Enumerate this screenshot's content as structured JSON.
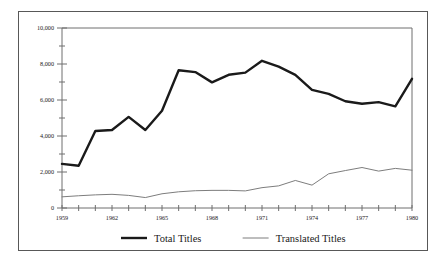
{
  "chart_data": {
    "type": "line",
    "title": "",
    "subtitle": "",
    "xlabel": "",
    "ylabel": "",
    "xlim": [
      1959,
      1980
    ],
    "ylim": [
      0,
      10000
    ],
    "grid": false,
    "legend_position": "bottom-center",
    "x": [
      1959,
      1960,
      1961,
      1962,
      1963,
      1964,
      1965,
      1966,
      1967,
      1968,
      1969,
      1970,
      1971,
      1972,
      1973,
      1974,
      1975,
      1976,
      1977,
      1978,
      1979,
      1980
    ],
    "x_tick_labels": [
      "1959",
      "1962",
      "1965",
      "1968",
      "1971",
      "1974",
      "1977",
      "1980"
    ],
    "x_tick_values": [
      1959,
      1962,
      1965,
      1968,
      1971,
      1974,
      1977,
      1980
    ],
    "y_tick_labels": [
      "0",
      "2,000",
      "4,000",
      "6,000",
      "8,000",
      "10,000"
    ],
    "y_tick_values": [
      0,
      2000,
      4000,
      6000,
      8000,
      10000
    ],
    "y_minor_tick_values": [
      1000,
      3000,
      5000,
      7000,
      9000
    ],
    "series": [
      {
        "name": "Total Titles",
        "color": "#1a1a1a",
        "width": 2.4,
        "values": [
          2450,
          2350,
          4280,
          4330,
          5060,
          4330,
          5400,
          7650,
          7550,
          6980,
          7400,
          7520,
          8180,
          7850,
          7400,
          6560,
          6340,
          5930,
          5790,
          5880,
          5650,
          7180
        ]
      },
      {
        "name": "Translated Titles",
        "color": "#7d7d7d",
        "width": 1.0,
        "values": [
          620,
          680,
          730,
          760,
          700,
          580,
          790,
          900,
          960,
          980,
          980,
          950,
          1130,
          1230,
          1530,
          1270,
          1900,
          2080,
          2250,
          2050,
          2200,
          2100
        ]
      }
    ]
  },
  "legend": {
    "items": [
      {
        "label": "Total Titles",
        "color": "#1a1a1a",
        "width": 2.4
      },
      {
        "label": "Translated Titles",
        "color": "#7d7d7d",
        "width": 1.0
      }
    ]
  },
  "axes": {
    "axis_color": "#6e6e6e",
    "frame_color": "#585858",
    "background": "#ffffff"
  }
}
